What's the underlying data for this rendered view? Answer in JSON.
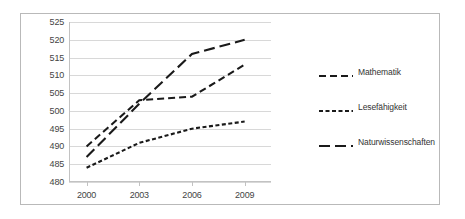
{
  "chart_data": {
    "type": "line",
    "title": "",
    "subtitle": "",
    "xlabel": "",
    "ylabel": "",
    "x": [
      2000,
      2003,
      2006,
      2009
    ],
    "categories": [
      "2000",
      "2003",
      "2006",
      "2009"
    ],
    "xlim": [
      1999,
      2010.5
    ],
    "ylim": [
      480,
      525
    ],
    "ytick_values": [
      480,
      485,
      490,
      495,
      500,
      505,
      510,
      515,
      520,
      525
    ],
    "ytick_labels": [
      "480",
      "485",
      "490",
      "495",
      "500",
      "505",
      "510",
      "515",
      "520",
      "525"
    ],
    "xtick_labels": [
      "2000",
      "2003",
      "2006",
      "2009"
    ],
    "grid": "horizontal",
    "legend_position": "right",
    "series": [
      {
        "name": "Mathematik",
        "dash": "medium-dash",
        "color": "#1a1a1a",
        "values": [
          490,
          503,
          504,
          513
        ]
      },
      {
        "name": "Lesefähigkeit",
        "dash": "short-dash",
        "color": "#1a1a1a",
        "values": [
          484,
          491,
          495,
          497
        ]
      },
      {
        "name": "Naturwissenschaften",
        "dash": "long-dash",
        "color": "#1a1a1a",
        "values": [
          487,
          502,
          516,
          520
        ]
      }
    ]
  },
  "legend": {
    "entries": [
      {
        "label": "Mathematik"
      },
      {
        "label": "Lesefähigkeit"
      },
      {
        "label": "Naturwissenschaften"
      }
    ]
  },
  "colors": {
    "line": "#1a1a1a",
    "grid": "#d8d8d8",
    "axis": "#c2c2c2",
    "frame": "#b9b9b9",
    "tick_text": "#444444",
    "legend_text": "#333333"
  }
}
